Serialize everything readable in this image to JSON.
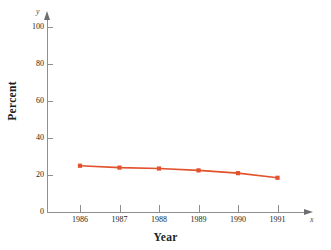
{
  "chart_data": {
    "type": "line",
    "title": "",
    "xlabel": "Year",
    "ylabel": "Percent",
    "x_axis_variable": "x",
    "y_axis_variable": "y",
    "categories": [
      "1986",
      "1987",
      "1988",
      "1989",
      "1990",
      "1991"
    ],
    "x": [
      1986,
      1987,
      1988,
      1989,
      1990,
      1991
    ],
    "values": [
      25.0,
      24.0,
      23.5,
      22.5,
      21.0,
      18.5
    ],
    "series": [
      {
        "name": "Percent",
        "values": [
          25.0,
          24.0,
          23.5,
          22.5,
          21.0,
          18.5
        ],
        "color": "#E2522C",
        "marker": "square"
      }
    ],
    "ylim": [
      0,
      100
    ],
    "yticks": [
      0,
      20,
      40,
      60,
      80,
      100
    ],
    "ytick_labels": [
      "0",
      "20",
      "40",
      "60",
      "80",
      "100"
    ],
    "xtick_labels": [
      "1986",
      "1987",
      "1988",
      "1989",
      "1990",
      "1991"
    ],
    "grid": false,
    "legend": "none",
    "axis_color": "#8E8E90",
    "text_color": "#231F20",
    "accent_color": "#E2522C"
  }
}
